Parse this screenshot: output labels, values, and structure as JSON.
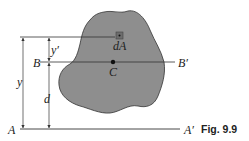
{
  "figure": {
    "caption": "Fig. 9.9",
    "colors": {
      "area_fill": "#8e8e8e",
      "area_stroke": "#333333",
      "line": "#333333",
      "background": "#ffffff"
    },
    "labels": {
      "axis_A": "A",
      "axis_A_prime": "A′",
      "axis_B": "B",
      "axis_B_prime": "B′",
      "centroid": "C",
      "element": "dA",
      "dim_y": "y",
      "dim_y_prime": "y′",
      "dim_d": "d"
    }
  }
}
